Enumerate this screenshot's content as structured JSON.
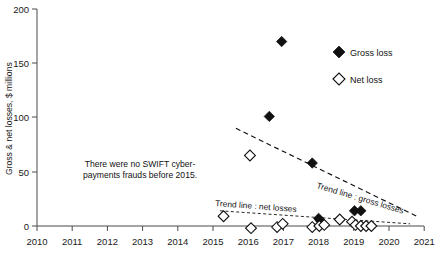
{
  "chart_data": {
    "type": "scatter",
    "title": "",
    "xlabel": "",
    "ylabel": "Gross & net losses, $ millions",
    "xlim": [
      2010,
      2021
    ],
    "ylim": [
      0,
      200
    ],
    "grid": false,
    "legend_position": "top-right",
    "x_ticks": [
      "2010",
      "2011",
      "2012",
      "2013",
      "2014",
      "2015",
      "2016",
      "2017",
      "2018",
      "2019",
      "2020",
      "2021"
    ],
    "y_ticks": [
      "0",
      "50",
      "100",
      "150",
      "200"
    ],
    "series": [
      {
        "name": "Gross loss",
        "marker": "filled-diamond",
        "color": "#111111",
        "points": [
          {
            "x": 2016.6,
            "y": 101
          },
          {
            "x": 2016.95,
            "y": 170
          },
          {
            "x": 2017.82,
            "y": 58
          },
          {
            "x": 2018.0,
            "y": 7
          },
          {
            "x": 2018.05,
            "y": 5
          },
          {
            "x": 2019.02,
            "y": 14
          },
          {
            "x": 2019.2,
            "y": 14
          }
        ]
      },
      {
        "name": "Net loss",
        "marker": "open-diamond",
        "color": "#ffffff",
        "points": [
          {
            "x": 2015.3,
            "y": 9
          },
          {
            "x": 2016.05,
            "y": 65
          },
          {
            "x": 2016.08,
            "y": -2
          },
          {
            "x": 2016.82,
            "y": -1
          },
          {
            "x": 2016.98,
            "y": 2
          },
          {
            "x": 2017.82,
            "y": -1
          },
          {
            "x": 2018.02,
            "y": 0
          },
          {
            "x": 2018.16,
            "y": 1
          },
          {
            "x": 2018.6,
            "y": 6
          },
          {
            "x": 2018.95,
            "y": 4
          },
          {
            "x": 2019.05,
            "y": 1
          },
          {
            "x": 2019.2,
            "y": 0
          },
          {
            "x": 2019.35,
            "y": 0
          },
          {
            "x": 2019.5,
            "y": 0
          }
        ]
      }
    ],
    "trend_lines": [
      {
        "name": "Trend line : gross losses",
        "label": "Trend line : gross losses",
        "x0": 2015.65,
        "y0": 90,
        "x1": 2020.85,
        "y1": 8,
        "style": "dashed"
      },
      {
        "name": "Trend line : net losses",
        "label": "Trend line : net losses",
        "x0": 2015.2,
        "y0": 14,
        "x1": 2020.6,
        "y1": 2,
        "style": "dotted-dashed"
      }
    ],
    "annotations": [
      {
        "name": "no-frauds-note",
        "line1": "There were no SWIFT cyber-",
        "line2": "payments frauds before 2015."
      }
    ]
  },
  "legend": {
    "items": [
      {
        "label": "Gross loss",
        "marker": "filled-diamond"
      },
      {
        "label": "Net loss",
        "marker": "open-diamond"
      }
    ]
  }
}
